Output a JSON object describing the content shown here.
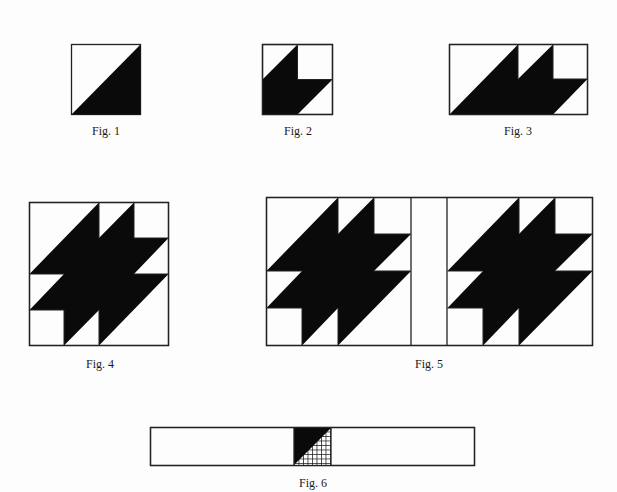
{
  "colors": {
    "ink": "#0a0a0a",
    "paper": "#fdfdfd",
    "line": "#222222"
  },
  "figures": [
    {
      "id": "fig1",
      "caption": "Fig. 1",
      "description": "Half-square triangle: square split on the diagonal, lower-right half dark"
    },
    {
      "id": "fig2",
      "caption": "Fig. 2",
      "description": "Leaf unit: square with dark parallelogram-shaped leaf portion, light upper-right square and light corner triangles"
    },
    {
      "id": "fig3",
      "caption": "Fig. 3",
      "description": "Two leaf units joined in a rectangle (1 x 2 units)"
    },
    {
      "id": "fig4",
      "caption": "Fig. 4",
      "description": "Full maple-leaf style block made of four leaf units arranged in a square"
    },
    {
      "id": "fig5",
      "caption": "Fig. 5",
      "description": "Two blocks joined by a vertical sashing strip"
    },
    {
      "id": "fig6",
      "caption": "Fig. 6",
      "description": "Long sashing strip with a cornerstone square in the center: dark triangle upper-left, checked/grid triangle lower-right"
    }
  ]
}
